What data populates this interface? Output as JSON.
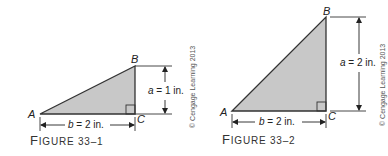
{
  "figures": [
    {
      "id": "fig1",
      "caption_first": "F",
      "caption_rest": "IGURE 33–1",
      "vertices": {
        "A": "A",
        "B": "B",
        "C": "C"
      },
      "side_a_label_var": "a",
      "side_a_label_val": " = 1 in.",
      "side_b_label_var": "b",
      "side_b_label_val": " = 2 in.",
      "copyright": "© Cengage Learning 2013"
    },
    {
      "id": "fig2",
      "caption_first": "F",
      "caption_rest": "IGURE 33–2",
      "vertices": {
        "A": "A",
        "B": "B",
        "C": "C"
      },
      "side_a_label_var": "a",
      "side_a_label_val": " = 2 in.",
      "side_b_label_var": "b",
      "side_b_label_val": " = 2 in.",
      "copyright": "© Cengage Learning 2013"
    }
  ],
  "colors": {
    "triangle_fill": "#c8c8c8",
    "stroke": "#333333"
  }
}
